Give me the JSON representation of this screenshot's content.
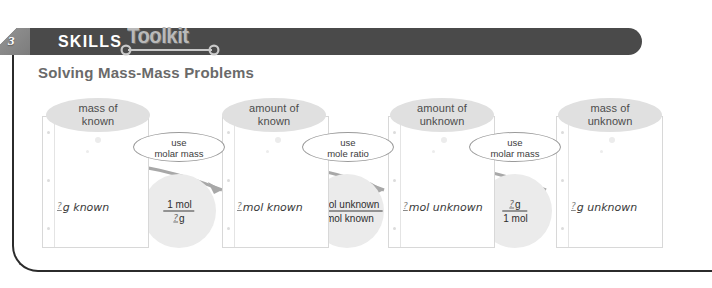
{
  "header": {
    "chapter_number": "3",
    "skills_label": "SKILLS",
    "toolkit_label": "Toolkit",
    "top_cut_text": "",
    "bar_color": "#4a4a4a",
    "toolkit_color": "#b9b9b9"
  },
  "title": "Solving Mass-Mass Problems",
  "diagram": {
    "type": "flowchart",
    "steps": [
      {
        "ellipse_label_line1": "mass of",
        "ellipse_label_line2": "known",
        "card_q": "?",
        "card_text": "g known"
      },
      {
        "ellipse_label_line1": "amount of",
        "ellipse_label_line2": "known",
        "card_q": "?",
        "card_text": "mol known"
      },
      {
        "ellipse_label_line1": "amount of",
        "ellipse_label_line2": "unknown",
        "card_q": "?",
        "card_text": "mol unknown"
      },
      {
        "ellipse_label_line1": "mass of",
        "ellipse_label_line2": "unknown",
        "card_q": "?",
        "card_text": "g unknown"
      }
    ],
    "operations": [
      {
        "oval_line1": "use",
        "oval_line2": "molar mass",
        "numerator_q": "",
        "numerator": "1 mol",
        "denominator_q": "?",
        "denominator": "g"
      },
      {
        "oval_line1": "use",
        "oval_line2": "mole ratio",
        "numerator_q": "?",
        "numerator": "mol unknown",
        "denominator_q": "?",
        "denominator": "mol known"
      },
      {
        "oval_line1": "use",
        "oval_line2": "molar mass",
        "numerator_q": "?",
        "numerator": "g",
        "denominator_q": "",
        "denominator": "1 mol"
      }
    ],
    "colors": {
      "ellipse": "#e0e0e0",
      "circle": "#ebebeb",
      "arrow": "#a8a8a8",
      "title": "#6a6a6a"
    }
  }
}
